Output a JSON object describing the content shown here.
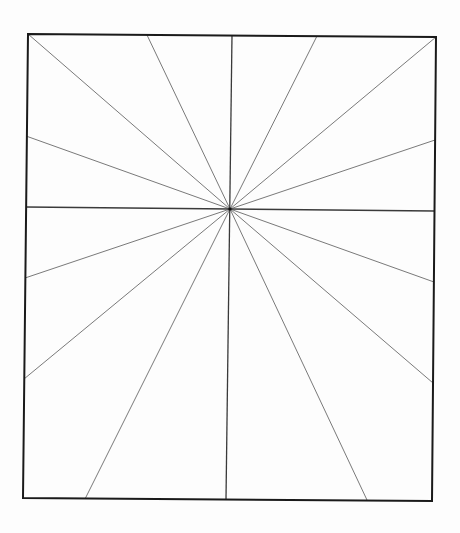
{
  "diagram": {
    "type": "radial-lines-in-rectangle",
    "colors": {
      "background": "#fdfdfd",
      "frame": "#1a1a1a",
      "axis_lines": "#3a3a3a",
      "rays": "#6a6a6a",
      "center_dot": "#111111"
    },
    "frame": {
      "corners": {
        "top_left": [
          28,
          34
        ],
        "top_right": [
          436,
          37
        ],
        "bottom_right": [
          432,
          501
        ],
        "bottom_left": [
          23,
          498
        ]
      },
      "stroke_width": 2
    },
    "center": [
      230,
      209
    ],
    "axis_lines": [
      {
        "name": "vertical",
        "from": [
          232,
          35
        ],
        "to": [
          226,
          499
        ]
      },
      {
        "name": "horizontal",
        "from": [
          26,
          207
        ],
        "to": [
          434,
          211
        ]
      }
    ],
    "rays": [
      {
        "name": "to-top-left-corner",
        "end": [
          28,
          34
        ]
      },
      {
        "name": "to-top-147",
        "end": [
          147,
          35
        ]
      },
      {
        "name": "to-top-317",
        "end": [
          317,
          36
        ]
      },
      {
        "name": "to-top-right-corner",
        "end": [
          436,
          37
        ]
      },
      {
        "name": "to-left-136",
        "end": [
          26,
          136
        ]
      },
      {
        "name": "to-left-278",
        "end": [
          25,
          278
        ]
      },
      {
        "name": "to-left-379",
        "end": [
          24,
          379
        ]
      },
      {
        "name": "to-right-140",
        "end": [
          435,
          140
        ]
      },
      {
        "name": "to-right-282",
        "end": [
          434,
          282
        ]
      },
      {
        "name": "to-right-383",
        "end": [
          433,
          383
        ]
      },
      {
        "name": "to-bottom-85",
        "end": [
          85,
          499
        ]
      },
      {
        "name": "to-bottom-367",
        "end": [
          367,
          500
        ]
      }
    ],
    "total_rays_from_center": 16
  },
  "page": {
    "bleed_through_text_top": "",
    "bleed_through_text_bottom": ""
  }
}
